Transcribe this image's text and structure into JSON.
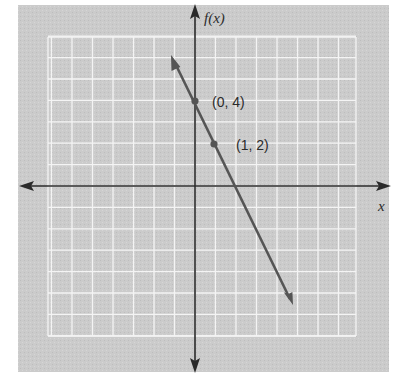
{
  "chart_data": {
    "type": "line",
    "title": "",
    "xlabel": "x",
    "ylabel": "f(x)",
    "grid": true,
    "x_range": [
      -7,
      8
    ],
    "y_range": [
      -7,
      7
    ],
    "series": [
      {
        "name": "f(x) = -2x + 4",
        "equation": "f(x) = -2x + 4",
        "slope": -2,
        "intercept": 4,
        "x": [
          -1.2,
          4.7
        ],
        "y": [
          6.4,
          -5.4
        ],
        "arrows_both_ends": true
      }
    ],
    "points": [
      {
        "x": 0,
        "y": 4,
        "label": "(0, 4)"
      },
      {
        "x": 1,
        "y": 2,
        "label": "(1, 2)"
      }
    ],
    "annotations": [
      "(0, 4)",
      "(1, 2)"
    ]
  },
  "labels": {
    "y_axis": "f(x)",
    "x_axis": "x",
    "point_a": "(0, 4)",
    "point_b": "(1, 2)"
  },
  "colors": {
    "panel": "#c9c9c9",
    "grid": "#f2f2f2",
    "axis": "#2a2a2a",
    "line": "#555555",
    "point": "#555555"
  }
}
